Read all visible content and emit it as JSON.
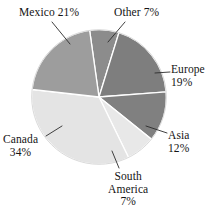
{
  "chart_data": {
    "type": "pie",
    "title": "",
    "subtitle": "",
    "xlabel": "",
    "ylabel": "",
    "legend_position": "none",
    "grid": false,
    "labels_inline": true,
    "start_angle_deg": 352,
    "direction": "clockwise",
    "categories": [
      "Other",
      "Europe",
      "Asia",
      "South America",
      "Canada",
      "Mexico"
    ],
    "values": [
      7,
      19,
      12,
      7,
      34,
      21
    ],
    "value_unit": "%",
    "slices": [
      {
        "name": "Other",
        "value": 7,
        "value_text": "7%",
        "label_text": "Other 7%",
        "color": "#8c8c8c",
        "start_deg": 352,
        "sweep_deg": 25.2
      },
      {
        "name": "Europe",
        "value": 19,
        "value_text": "19%",
        "label_text": "Europe 19%",
        "color": "#7e7e7e",
        "start_deg": 17.2,
        "sweep_deg": 68.4
      },
      {
        "name": "Asia",
        "value": 12,
        "value_text": "12%",
        "label_text": "Asia 12%",
        "color": "#808080",
        "start_deg": 85.6,
        "sweep_deg": 43.2
      },
      {
        "name": "South America",
        "value": 7,
        "value_text": "7%",
        "label_text": "South America 7%",
        "color": "#e8e8e8",
        "start_deg": 128.8,
        "sweep_deg": 25.2
      },
      {
        "name": "Canada",
        "value": 34,
        "value_text": "34%",
        "label_text": "Canada 34%",
        "color": "#e4e4e4",
        "start_deg": 154.0,
        "sweep_deg": 122.4
      },
      {
        "name": "Mexico",
        "value": 21,
        "value_text": "21%",
        "label_text": "Mexico 21%",
        "color": "#9d9d9d",
        "start_deg": 276.4,
        "sweep_deg": 75.6
      }
    ]
  },
  "labels": {
    "mexico": {
      "line1": "Mexico 21%"
    },
    "other": {
      "line1": "Other 7%"
    },
    "europe": {
      "line1": "Europe",
      "line2": "19%"
    },
    "asia": {
      "line1": "Asia",
      "line2": "12%"
    },
    "canada": {
      "line1": "Canada",
      "line2": "34%"
    },
    "south_america": {
      "line1": "South",
      "line2": "America",
      "line3": "7%"
    }
  },
  "style": {
    "background": "#ffffff",
    "slice_divider_color": "#ffffff",
    "leader_line_color": "#2b2b2b",
    "text_color": "#141414"
  }
}
